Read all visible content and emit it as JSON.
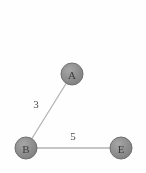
{
  "canvas": {
    "width": 146,
    "height": 173,
    "background_color": "#fefefe"
  },
  "chart_data": {
    "type": "diagram",
    "title": "",
    "subtitle": "",
    "xlabel": "",
    "ylabel": "",
    "graph_kind": "undirected weighted graph",
    "node_color": "#8c8c8c",
    "node_stroke_color": "#6f6f6f",
    "node_label_color": "#3a3a3a",
    "edge_color": "#b4b4b4",
    "edge_label_color": "#4a4a4a",
    "nodes": [
      {
        "id": "A",
        "label": "A",
        "x": 72,
        "y": 74,
        "r": 11
      },
      {
        "id": "B",
        "label": "B",
        "x": 26,
        "y": 148,
        "r": 11
      },
      {
        "id": "E",
        "label": "E",
        "x": 121,
        "y": 148,
        "r": 11
      }
    ],
    "edges": [
      {
        "id": "edge-a-b",
        "source": "A",
        "target": "B",
        "weight": "3",
        "label_x": 36,
        "label_y": 104
      },
      {
        "id": "edge-b-e",
        "source": "B",
        "target": "E",
        "weight": "5",
        "label_x": 73,
        "label_y": 136
      }
    ]
  }
}
